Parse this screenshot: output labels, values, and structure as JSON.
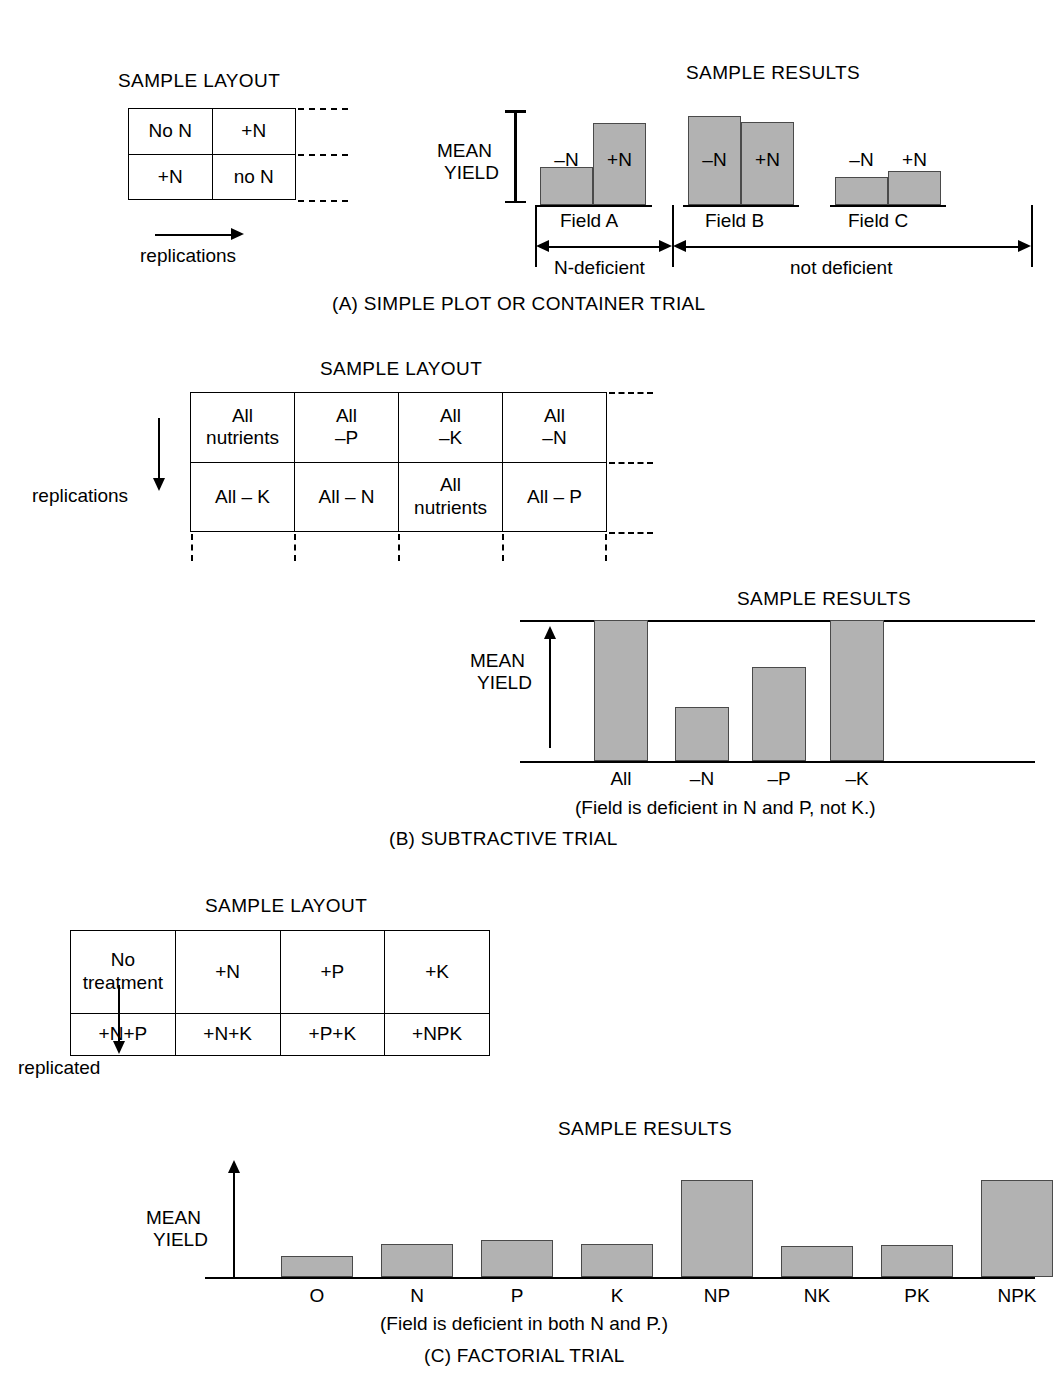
{
  "figure": {
    "sample_layout_title": "SAMPLE LAYOUT",
    "sample_results_title": "SAMPLE RESULTS",
    "mean_yield_line1": "MEAN",
    "mean_yield_line2": "YIELD"
  },
  "panel_a": {
    "caption": "(A) SIMPLE PLOT OR CONTAINER TRIAL",
    "layout_title": "SAMPLE LAYOUT",
    "results_title": "SAMPLE RESULTS",
    "axis_label_1": "MEAN",
    "axis_label_2": "YIELD",
    "replications_label": "replications",
    "table": [
      [
        "No N",
        "+N"
      ],
      [
        "+N",
        "no N"
      ]
    ],
    "group_labels": [
      "Field A",
      "Field B",
      "Field C"
    ],
    "bracket_labels": [
      "N-deficient",
      "not deficient"
    ]
  },
  "panel_b": {
    "caption": "(B) SUBTRACTIVE TRIAL",
    "layout_title": "SAMPLE LAYOUT",
    "results_title": "SAMPLE RESULTS",
    "axis_label_1": "MEAN",
    "axis_label_2": "YIELD",
    "replications_label": "replications",
    "note": "(Field is deficient in N and P, not K.)",
    "table": [
      [
        "All\nnutrients",
        "All\n–P",
        "All\n–K",
        "All\n–N"
      ],
      [
        "All – K",
        "All – N",
        "All\nnutrients",
        "All – P"
      ]
    ]
  },
  "panel_c": {
    "caption": "(C) FACTORIAL TRIAL",
    "layout_title": "SAMPLE LAYOUT",
    "results_title": "SAMPLE RESULTS",
    "axis_label_1": "MEAN",
    "axis_label_2": "YIELD",
    "replicated_label": "replicated",
    "note": "(Field is deficient in both N and P.)",
    "table": [
      [
        "No\ntreatment",
        "+N",
        "+P",
        "+K"
      ],
      [
        "+N+P",
        "+N+K",
        "+P+K",
        "+NPK"
      ]
    ]
  },
  "colors": {
    "bar_fill": "#b2b2b2",
    "bar_stroke": "#4a4a4a",
    "ink": "#000000"
  },
  "chart_data": [
    {
      "type": "bar",
      "id": "panel-a-results",
      "title": "SAMPLE RESULTS",
      "xlabel": "",
      "ylabel": "MEAN YIELD",
      "grid": false,
      "ylim": [
        0,
        100
      ],
      "groups": [
        "Field A",
        "Field B",
        "Field C"
      ],
      "categories": [
        "–N",
        "+N",
        "–N",
        "+N",
        "–N",
        "+N"
      ],
      "series": [
        {
          "name": "–N",
          "values": [
            36,
            85,
            27
          ]
        },
        {
          "name": "+N",
          "values": [
            78,
            79,
            32
          ]
        }
      ],
      "bar_labels": [
        "–N",
        "+N",
        "–N",
        "+N",
        "–N",
        "+N"
      ],
      "annotations": [
        "N-deficient",
        "not deficient"
      ]
    },
    {
      "type": "bar",
      "id": "panel-b-results",
      "title": "SAMPLE RESULTS",
      "xlabel": "",
      "ylabel": "MEAN YIELD",
      "grid": false,
      "ylim": [
        0,
        100
      ],
      "categories": [
        "All",
        "–N",
        "–P",
        "–K"
      ],
      "values": [
        100,
        38,
        67,
        100
      ],
      "annotations": [
        "(Field is deficient in N and P, not K.)"
      ]
    },
    {
      "type": "bar",
      "id": "panel-c-results",
      "title": "SAMPLE RESULTS",
      "xlabel": "",
      "ylabel": "MEAN YIELD",
      "grid": false,
      "ylim": [
        0,
        100
      ],
      "categories": [
        "O",
        "N",
        "P",
        "K",
        "NP",
        "NK",
        "PK",
        "NPK"
      ],
      "values": [
        21,
        33,
        37,
        33,
        97,
        31,
        32,
        97
      ],
      "annotations": [
        "(Field is deficient in both N and P.)"
      ]
    }
  ]
}
